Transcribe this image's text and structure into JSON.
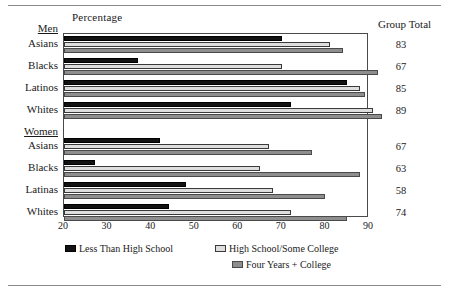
{
  "chart_data": {
    "type": "bar",
    "orientation": "horizontal",
    "title": "",
    "xlabel": "Percentage",
    "ylabel": "",
    "xlim": [
      20,
      90
    ],
    "xticks": [
      20,
      30,
      40,
      50,
      60,
      70,
      80,
      90
    ],
    "grid": false,
    "legend_position": "bottom",
    "series": [
      {
        "name": "Less Than High School",
        "color": "#121212",
        "values": [
          70,
          37,
          85,
          72,
          42,
          27,
          48,
          44
        ]
      },
      {
        "name": "High School/Some College",
        "color": "#dedede",
        "values": [
          81,
          70,
          88,
          91,
          67,
          65,
          68,
          72
        ]
      },
      {
        "name": "Four Years + College",
        "color": "#8e8e8e",
        "values": [
          84,
          92,
          89,
          93,
          77,
          88,
          80,
          85
        ]
      }
    ],
    "categories": [
      "Asians",
      "Blacks",
      "Latinos",
      "Whites",
      "Asians",
      "Blacks",
      "Latinas",
      "Whites"
    ],
    "groups": [
      {
        "label": "Men",
        "categories": [
          "Asians",
          "Blacks",
          "Latinos",
          "Whites"
        ]
      },
      {
        "label": "Women",
        "categories": [
          "Asians",
          "Blacks",
          "Latinas",
          "Whites"
        ]
      }
    ],
    "annotations": {
      "group_total_header": "Group Total",
      "group_totals": [
        83,
        67,
        85,
        89,
        67,
        63,
        58,
        74
      ]
    }
  },
  "headers": {
    "percentage": "Percentage",
    "group_total": "Group Total"
  },
  "groups": {
    "men": "Men",
    "women": "Women"
  },
  "rows": [
    {
      "label": "Asians",
      "group": "Men",
      "v1": 70,
      "v2": 81,
      "v3": 84,
      "total": "83"
    },
    {
      "label": "Blacks",
      "group": "Men",
      "v1": 37,
      "v2": 70,
      "v3": 92,
      "total": "67"
    },
    {
      "label": "Latinos",
      "group": "Men",
      "v1": 85,
      "v2": 88,
      "v3": 89,
      "total": "85"
    },
    {
      "label": "Whites",
      "group": "Men",
      "v1": 72,
      "v2": 91,
      "v3": 93,
      "total": "89"
    },
    {
      "label": "Asians",
      "group": "Women",
      "v1": 42,
      "v2": 67,
      "v3": 77,
      "total": "67"
    },
    {
      "label": "Blacks",
      "group": "Women",
      "v1": 27,
      "v2": 65,
      "v3": 88,
      "total": "63"
    },
    {
      "label": "Latinas",
      "group": "Women",
      "v1": 48,
      "v2": 68,
      "v3": 80,
      "total": "58"
    },
    {
      "label": "Whites",
      "group": "Women",
      "v1": 44,
      "v2": 72,
      "v3": 85,
      "total": "74"
    }
  ],
  "axis": {
    "ticks": [
      "20",
      "30",
      "40",
      "50",
      "60",
      "70",
      "80",
      "90"
    ]
  },
  "legend": [
    {
      "label": "Less Than High School",
      "swatch": "s1"
    },
    {
      "label": "High School/Some College",
      "swatch": "s2"
    },
    {
      "label": "Four Years + College",
      "swatch": "s3"
    }
  ]
}
